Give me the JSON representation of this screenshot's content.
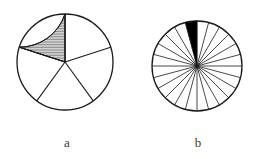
{
  "figure": {
    "canvas": {
      "width": 261,
      "height": 159,
      "background": "#ffffff"
    },
    "ink_color": "#1a1a1a",
    "fill_color": "#000000",
    "hatch_color": "#2b2b2b",
    "label_color": "#3a3a3a",
    "panels": [
      {
        "id": "panel-a",
        "label": "a",
        "label_x": 67,
        "label_y": 147,
        "circle": {
          "cx": 65,
          "cy": 62,
          "r": 48,
          "stroke_width": 1.3
        },
        "sector_count": 5,
        "sector_angle_deg": 72,
        "start_angle_deg": 90,
        "spoke_angles_deg": [
          90,
          162,
          234,
          306,
          18
        ],
        "marked_sectors": [
          {
            "index": 0,
            "start_angle_deg": 90,
            "end_angle_deg": 162,
            "style": "horizontal-hatch"
          }
        ],
        "hatch": {
          "orientation": "horizontal",
          "spacing_px": 1.6,
          "line_width": 0.55
        },
        "fraction_text": "1/5"
      },
      {
        "id": "panel-b",
        "label": "b",
        "label_x": 198,
        "label_y": 147,
        "circle": {
          "cx": 197,
          "cy": 66,
          "r": 45,
          "stroke_width": 1.3
        },
        "sector_count": 24,
        "sector_angle_deg": 15,
        "start_angle_deg": 90,
        "marked_sectors": [
          {
            "index": 0,
            "start_angle_deg": 90,
            "end_angle_deg": 105,
            "style": "solid-black"
          }
        ],
        "spoke_line_width": 0.8,
        "fraction_text": "1/24"
      }
    ]
  }
}
